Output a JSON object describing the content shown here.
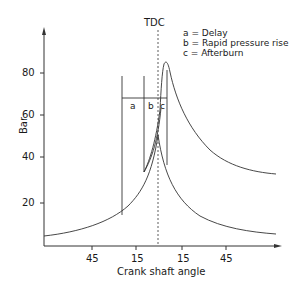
{
  "diagram": {
    "type": "pressure-crank-angle",
    "tdc_label": "TDC",
    "y_axis": {
      "label": "Bar",
      "ticks": [
        "20",
        "40",
        "60",
        "80"
      ]
    },
    "x_axis": {
      "label": "Crank shaft angle",
      "ticks": [
        "45",
        "15",
        "15",
        "45"
      ]
    },
    "phase_labels": {
      "a": "a",
      "b": "b",
      "c": "c"
    },
    "legend": [
      "a = Delay",
      "b = Rapid pressure rise",
      "c = Afterburn"
    ],
    "colors": {
      "line": "#333333",
      "text": "#1a1a1a",
      "background": "#ffffff"
    }
  }
}
